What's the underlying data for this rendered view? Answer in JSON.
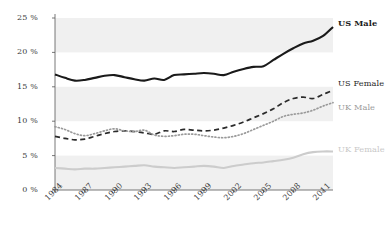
{
  "chart_data": {
    "type": "line",
    "title": "",
    "subtitle": "",
    "xlabel": "",
    "ylabel": "",
    "ylim": [
      0,
      25
    ],
    "xlim": [
      1984,
      2012
    ],
    "grid": false,
    "banded_background": true,
    "legend_position": "inline-right",
    "y_ticks": [
      0,
      5,
      10,
      15,
      20,
      25
    ],
    "y_tick_labels": [
      "0 %",
      "5 %",
      "10 %",
      "15 %",
      "20 %",
      "25 %"
    ],
    "x_ticks": [
      1984,
      1987,
      1990,
      1993,
      1996,
      1999,
      2002,
      2005,
      2008,
      2011
    ],
    "x_tick_labels": [
      "1984",
      "1987",
      "1990",
      "1993",
      "1996",
      "1999",
      "2002",
      "2005",
      "2008",
      "2011"
    ],
    "x": [
      1984,
      1985,
      1986,
      1987,
      1988,
      1989,
      1990,
      1991,
      1992,
      1993,
      1994,
      1995,
      1996,
      1997,
      1998,
      1999,
      2000,
      2001,
      2002,
      2003,
      2004,
      2005,
      2006,
      2007,
      2008,
      2009,
      2010,
      2011,
      2012
    ],
    "series": [
      {
        "name": "US Male",
        "color": "#1a1a1a",
        "style": "solid",
        "width": 2.1,
        "values": [
          16.8,
          16.3,
          15.9,
          16.0,
          16.3,
          16.6,
          16.7,
          16.4,
          16.1,
          15.9,
          16.2,
          16.0,
          16.7,
          16.8,
          16.9,
          17.0,
          16.9,
          16.7,
          17.2,
          17.6,
          17.9,
          18.0,
          18.9,
          19.8,
          20.6,
          21.3,
          21.7,
          22.4,
          23.7
        ]
      },
      {
        "name": "US Female",
        "color": "#2b2b2b",
        "style": "dashed",
        "width": 1.7,
        "values": [
          7.8,
          7.5,
          7.3,
          7.4,
          7.8,
          8.2,
          8.5,
          8.6,
          8.5,
          8.3,
          8.1,
          8.6,
          8.5,
          8.8,
          8.7,
          8.6,
          8.7,
          9.0,
          9.4,
          9.9,
          10.5,
          11.1,
          11.8,
          12.7,
          13.3,
          13.5,
          13.3,
          13.9,
          14.5
        ]
      },
      {
        "name": "UK Male",
        "color": "#9a9a9a",
        "style": "dotted",
        "width": 1.7,
        "values": [
          9.2,
          8.8,
          8.2,
          7.9,
          8.2,
          8.6,
          8.9,
          8.6,
          8.5,
          8.7,
          8.0,
          7.8,
          7.9,
          8.1,
          8.1,
          7.9,
          7.7,
          7.6,
          7.8,
          8.2,
          8.8,
          9.4,
          10.0,
          10.7,
          11.0,
          11.2,
          11.6,
          12.2,
          12.7
        ]
      },
      {
        "name": "UK Female",
        "color": "#cccccc",
        "style": "solid",
        "width": 2.1,
        "values": [
          3.2,
          3.1,
          3.0,
          3.1,
          3.1,
          3.2,
          3.3,
          3.4,
          3.5,
          3.6,
          3.4,
          3.3,
          3.2,
          3.3,
          3.4,
          3.5,
          3.4,
          3.2,
          3.5,
          3.7,
          3.9,
          4.0,
          4.2,
          4.4,
          4.7,
          5.2,
          5.5,
          5.6,
          5.6
        ]
      }
    ],
    "bands": [
      {
        "from": 20,
        "to": 25
      },
      {
        "from": 10,
        "to": 15
      },
      {
        "from": 0,
        "to": 5
      }
    ],
    "band_color": "#f0f0f0",
    "axis_color": "#555555",
    "background": "#ffffff"
  },
  "legend": {
    "items": [
      {
        "label": "US Male"
      },
      {
        "label": "US Female"
      },
      {
        "label": "UK Male"
      },
      {
        "label": "UK Female"
      }
    ]
  }
}
